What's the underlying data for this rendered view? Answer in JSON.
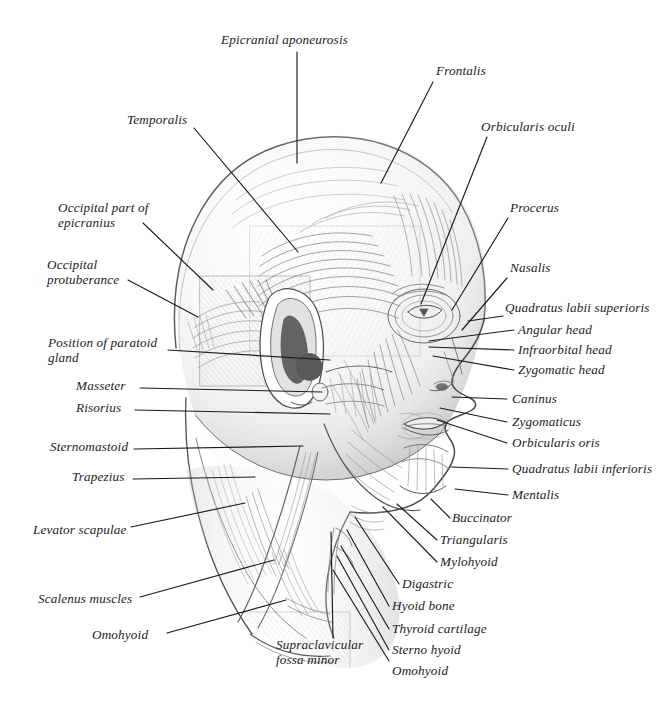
{
  "figure": {
    "background_color": "#ffffff",
    "ink_color": "#1b1b1b",
    "pencil_color": "#6f6f6f",
    "width": 666,
    "height": 712
  },
  "labels": [
    {
      "id": "epicranial-aponeurosis",
      "text": "Epicranial aponeurosis",
      "x": 221,
      "y": 33,
      "side": "top",
      "leader": [
        [
          297,
          52
        ],
        [
          297,
          163
        ]
      ]
    },
    {
      "id": "frontalis",
      "text": "Frontalis",
      "x": 436,
      "y": 64,
      "leader": [
        [
          433,
          82
        ],
        [
          381,
          183
        ]
      ]
    },
    {
      "id": "temporalis",
      "text": "Temporalis",
      "x": 127,
      "y": 113,
      "leader": [
        [
          194,
          128
        ],
        [
          298,
          252
        ]
      ]
    },
    {
      "id": "orbicularis-oculi",
      "text": "Orbicularis oculi",
      "x": 481,
      "y": 120,
      "leader": [
        [
          487,
          137
        ],
        [
          421,
          304
        ]
      ]
    },
    {
      "id": "occipital-part-of-epicranius",
      "text": "Occipital part of\nepicranius",
      "x": 58,
      "y": 201,
      "leader": [
        [
          143,
          223
        ],
        [
          213,
          290
        ]
      ]
    },
    {
      "id": "procerus",
      "text": "Procerus",
      "x": 510,
      "y": 201,
      "leader": [
        [
          508,
          218
        ],
        [
          452,
          310
        ]
      ]
    },
    {
      "id": "occipital-protuberance",
      "text": "Occipital\nprotuberance",
      "x": 47,
      "y": 258,
      "leader": [
        [
          128,
          280
        ],
        [
          198,
          317
        ]
      ]
    },
    {
      "id": "nasalis",
      "text": "Nasalis",
      "x": 510,
      "y": 261,
      "leader": [
        [
          507,
          278
        ],
        [
          462,
          330
        ]
      ]
    },
    {
      "id": "quadratus-labii-superioris",
      "text": "Quadratus labii superioris",
      "x": 505,
      "y": 301,
      "leader": [
        [
          503,
          316
        ],
        [
          468,
          321
        ]
      ]
    },
    {
      "id": "position-of-paratoid-gland",
      "text": "Position of paratoid\ngland",
      "x": 48,
      "y": 336,
      "leader": [
        [
          168,
          350
        ],
        [
          330,
          360
        ]
      ]
    },
    {
      "id": "angular-head",
      "text": "Angular head",
      "x": 518,
      "y": 323,
      "leader": [
        [
          514,
          330
        ],
        [
          429,
          341
        ]
      ]
    },
    {
      "id": "infraorbital-head",
      "text": "Infraorbital head",
      "x": 518,
      "y": 343,
      "leader": [
        [
          514,
          350
        ],
        [
          429,
          347
        ]
      ]
    },
    {
      "id": "zygomatic-head",
      "text": "Zygomatic head",
      "x": 518,
      "y": 363,
      "leader": [
        [
          514,
          370
        ],
        [
          433,
          356
        ]
      ]
    },
    {
      "id": "masseter",
      "text": "Masseter",
      "x": 76,
      "y": 379,
      "leader": [
        [
          140,
          388
        ],
        [
          322,
          392
        ]
      ]
    },
    {
      "id": "risorius",
      "text": "Risorius",
      "x": 76,
      "y": 401,
      "leader": [
        [
          135,
          410
        ],
        [
          330,
          414
        ]
      ]
    },
    {
      "id": "caninus",
      "text": "Caninus",
      "x": 512,
      "y": 392,
      "leader": [
        [
          507,
          399
        ],
        [
          452,
          397
        ]
      ]
    },
    {
      "id": "zygomaticus",
      "text": "Zygomaticus",
      "x": 512,
      "y": 415,
      "leader": [
        [
          507,
          422
        ],
        [
          440,
          408
        ]
      ]
    },
    {
      "id": "orbicularis-oris",
      "text": "Orbicularis oris",
      "x": 512,
      "y": 436,
      "leader": [
        [
          507,
          443
        ],
        [
          437,
          420
        ]
      ]
    },
    {
      "id": "sternomastoid",
      "text": "Sternomastoid",
      "x": 50,
      "y": 440,
      "leader": [
        [
          134,
          449
        ],
        [
          303,
          446
        ]
      ]
    },
    {
      "id": "trapezius",
      "text": "Trapezius",
      "x": 72,
      "y": 470,
      "leader": [
        [
          133,
          479
        ],
        [
          255,
          477
        ]
      ]
    },
    {
      "id": "quadratus-labii-inferioris",
      "text": "Quadratus labii inferioris",
      "x": 512,
      "y": 462,
      "leader": [
        [
          508,
          469
        ],
        [
          451,
          467
        ]
      ]
    },
    {
      "id": "mentalis",
      "text": "Mentalis",
      "x": 512,
      "y": 488,
      "leader": [
        [
          508,
          495
        ],
        [
          455,
          489
        ]
      ]
    },
    {
      "id": "levator-scapulae",
      "text": "Levator scapulae",
      "x": 33,
      "y": 523,
      "leader": [
        [
          131,
          527
        ],
        [
          245,
          503
        ]
      ]
    },
    {
      "id": "buccinator",
      "text": "Buccinator",
      "x": 452,
      "y": 511,
      "leader": [
        [
          450,
          518
        ],
        [
          431,
          499
        ]
      ]
    },
    {
      "id": "triangularis",
      "text": "Triangularis",
      "x": 440,
      "y": 533,
      "leader": [
        [
          437,
          540
        ],
        [
          397,
          504
        ]
      ]
    },
    {
      "id": "mylohyoid",
      "text": "Mylohyoid",
      "x": 440,
      "y": 555,
      "leader": [
        [
          437,
          562
        ],
        [
          383,
          507
        ]
      ]
    },
    {
      "id": "digastric",
      "text": "Digastric",
      "x": 402,
      "y": 577,
      "leader": [
        [
          399,
          584
        ],
        [
          355,
          517
        ]
      ]
    },
    {
      "id": "scalenus-muscles",
      "text": "Scalenus muscles",
      "x": 38,
      "y": 592,
      "leader": [
        [
          140,
          597
        ],
        [
          274,
          560
        ]
      ]
    },
    {
      "id": "hyoid-bone",
      "text": "Hyoid bone",
      "x": 392,
      "y": 599,
      "leader": [
        [
          389,
          606
        ],
        [
          347,
          530
        ]
      ]
    },
    {
      "id": "thyroid-cartilage",
      "text": "Thyroid cartilage",
      "x": 392,
      "y": 622,
      "leader": [
        [
          389,
          629
        ],
        [
          341,
          546
        ]
      ]
    },
    {
      "id": "sterno-hyoid",
      "text": "Sterno hyoid",
      "x": 392,
      "y": 643,
      "leader": [
        [
          389,
          650
        ],
        [
          337,
          556
        ]
      ]
    },
    {
      "id": "omohyoid-upper",
      "text": "Omohyoid",
      "x": 92,
      "y": 628,
      "leader": [
        [
          167,
          633
        ],
        [
          286,
          600
        ]
      ]
    },
    {
      "id": "supraclavicular-fossa-minor",
      "text": "Supraclavicular\nfossa minor",
      "x": 276,
      "y": 638,
      "leader": [
        [
          333,
          638
        ],
        [
          331,
          532
        ]
      ]
    },
    {
      "id": "omohyoid-lower",
      "text": "Omohyoid",
      "x": 392,
      "y": 664,
      "leader": [
        [
          389,
          661
        ],
        [
          333,
          570
        ]
      ]
    }
  ]
}
